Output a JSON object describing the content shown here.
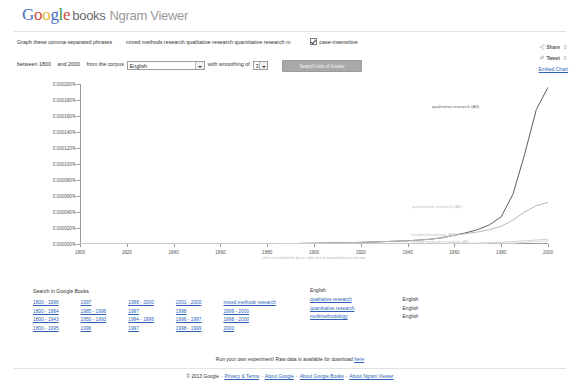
{
  "header": {
    "logo": {
      "google": "Google",
      "books": "books",
      "product": "Ngram Viewer"
    }
  },
  "query": {
    "graph_label": "Graph these comma-separated phrases",
    "phrases_value": "mixed methods research qualitative research quantitative research m",
    "phrases_placeholder": "Enter comma-separated phrases",
    "case_insensitive_label": "case-insensitive",
    "case_insensitive_checked": true
  },
  "controls": {
    "between_label": "between",
    "year_start": "1800",
    "and_label": "and",
    "year_end": "2000",
    "corpus_label": "from the corpus",
    "corpus_value": "English",
    "smoothing_label": "with smoothing of",
    "smoothing_value": "3",
    "search_button": "Search lots of books"
  },
  "share": {
    "share_label": "Share",
    "share_count": "0",
    "tweet_label": "Tweet",
    "tweet_count": "0",
    "embed_label": "Embed Chart"
  },
  "chart_data": {
    "type": "line",
    "title": "",
    "xlabel": "",
    "ylabel": "",
    "note": "click on line/label for focus, right click to expand/contract timeline",
    "xlim": [
      1800,
      2000
    ],
    "ylim": [
      0,
      0.0002
    ],
    "grid": false,
    "legend": "inline-right",
    "xticks": [
      "1800",
      "1820",
      "1840",
      "1860",
      "1880",
      "1900",
      "1920",
      "1940",
      "1960",
      "1980",
      "2000"
    ],
    "yticks": [
      "0.000200%",
      "0.000180%",
      "0.000160%",
      "0.000140%",
      "0.000120%",
      "0.000100%",
      "0.000080%",
      "0.000060%",
      "0.000040%",
      "0.000020%",
      "0.000000%"
    ],
    "x": [
      1800,
      1820,
      1840,
      1860,
      1880,
      1900,
      1920,
      1930,
      1940,
      1950,
      1955,
      1960,
      1965,
      1970,
      1975,
      1980,
      1985,
      1990,
      1995,
      2000
    ],
    "series": [
      {
        "name": "qualitative research (All)",
        "color": "#5c5c5c",
        "values": [
          0,
          0,
          0,
          0,
          0,
          1e-06,
          2e-06,
          3e-06,
          4e-06,
          6e-06,
          8e-06,
          1.1e-05,
          1.4e-05,
          1.8e-05,
          2.4e-05,
          3.4e-05,
          6.2e-05,
          0.000112,
          0.000168,
          0.000196
        ]
      },
      {
        "name": "quantitative research (All)",
        "color": "#b8b8b8",
        "values": [
          0,
          0,
          0,
          0,
          0,
          1e-06,
          2e-06,
          3e-06,
          4e-06,
          6e-06,
          8e-06,
          1.1e-05,
          1.3e-05,
          1.5e-05,
          1.8e-05,
          2.2e-05,
          3e-05,
          4e-05,
          4.8e-05,
          5.2e-05
        ]
      },
      {
        "name": "multimethodology (All)",
        "color": "#d2d2d2",
        "values": [
          0,
          0,
          0,
          0,
          0,
          0,
          0,
          0,
          0,
          0,
          0,
          1e-06,
          1e-06,
          1e-06,
          2e-06,
          2e-06,
          3e-06,
          4e-06,
          5e-06,
          6e-06
        ]
      },
      {
        "name": "mixed methods research (All)",
        "color": "#dcdcdc",
        "values": [
          0,
          0,
          0,
          0,
          0,
          0,
          0,
          0,
          0,
          0,
          0,
          0,
          0,
          0,
          1e-06,
          1e-06,
          1e-06,
          2e-06,
          3e-06,
          4e-06
        ]
      }
    ]
  },
  "bottom": {
    "search_title": "Search in Google Books",
    "link_rows": [
      [
        "1800 - 1996",
        "1997",
        "1998 - 2000",
        "2001 - 2000",
        "mixed methods research"
      ],
      [
        "1800 - 1984",
        "1985 - 1996",
        "1997",
        "1998",
        "1999 - 2000"
      ],
      [
        "1800 - 1943",
        "1950 - 1993",
        "1994 - 1996",
        "1996 - 1997",
        "1998 - 2000"
      ],
      [
        "1800 - 1995",
        "1996",
        "1997",
        "1998 - 1999",
        "2000"
      ]
    ],
    "language_header": "English",
    "language_rows": [
      {
        "phrase": "qualitative research",
        "language": "English"
      },
      {
        "phrase": "quantitative research",
        "language": "English"
      },
      {
        "phrase": "multimethodology",
        "language": "English"
      }
    ]
  },
  "footer": {
    "experiment_text": "Run your own experiment! Raw data is available for download",
    "experiment_link": "here",
    "copyright": "© 2013 Google",
    "links": [
      "Privacy & Terms",
      "About Google",
      "About Google Books",
      "About Ngram Viewer"
    ]
  }
}
